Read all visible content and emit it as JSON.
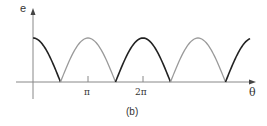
{
  "figure": {
    "caption": "(b)",
    "y_axis_label": "e",
    "x_axis_label": "θ",
    "x_ticks": [
      "π",
      "2π"
    ]
  },
  "colors": {
    "axis": "#888888",
    "positive_half": "#222222",
    "rectified_half": "#9a9a9a",
    "background": "#ffffff"
  },
  "chart_data": {
    "type": "line",
    "title": "",
    "caption": "(b)",
    "xlabel": "θ",
    "ylabel": "e",
    "x_tick_labels": [
      "π",
      "2π"
    ],
    "x_tick_values": [
      3.1416,
      6.2832
    ],
    "xlim": [
      0,
      12.4
    ],
    "ylim": [
      0,
      1
    ],
    "grid": false,
    "legend": null,
    "series": [
      {
        "name": "positive half-cycle",
        "color": "#222222",
        "x_range": [
          0,
          1.5708
        ],
        "function": "cos θ"
      },
      {
        "name": "rectified half-cycle",
        "color": "#9a9a9a",
        "x_range": [
          1.5708,
          4.7124
        ],
        "function": "-cos θ"
      },
      {
        "name": "positive half-cycle",
        "color": "#222222",
        "x_range": [
          4.7124,
          7.854
        ],
        "function": "cos θ"
      },
      {
        "name": "rectified half-cycle",
        "color": "#9a9a9a",
        "x_range": [
          7.854,
          10.9956
        ],
        "function": "-cos θ"
      },
      {
        "name": "positive half-cycle",
        "color": "#222222",
        "x_range": [
          10.9956,
          12.4
        ],
        "function": "cos θ"
      }
    ],
    "zeros": [
      1.5708,
      4.7124,
      7.854,
      10.9956
    ],
    "peak_value": 1
  }
}
